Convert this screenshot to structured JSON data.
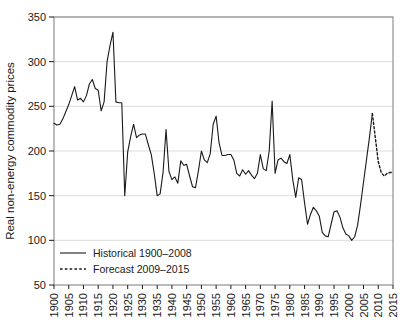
{
  "chart_data": {
    "type": "line",
    "title": "",
    "xlabel": "",
    "ylabel": "Real non-energy commodity prices",
    "xlim": [
      1900,
      2015
    ],
    "ylim": [
      50,
      350
    ],
    "grid": true,
    "legend_position": "bottom-left",
    "y_ticks": [
      50,
      100,
      150,
      200,
      250,
      300,
      350
    ],
    "x_ticks": [
      1900,
      1905,
      1910,
      1915,
      1920,
      1925,
      1930,
      1935,
      1940,
      1945,
      1950,
      1955,
      1960,
      1965,
      1970,
      1975,
      1980,
      1985,
      1990,
      1995,
      2000,
      2005,
      2010,
      2015
    ],
    "series": [
      {
        "name": "Historical 1900–2008",
        "style": "solid",
        "color": "#1a1a1a",
        "x": [
          1900,
          1901,
          1902,
          1903,
          1904,
          1905,
          1906,
          1907,
          1908,
          1909,
          1910,
          1911,
          1912,
          1913,
          1914,
          1915,
          1916,
          1917,
          1918,
          1919,
          1920,
          1921,
          1922,
          1923,
          1924,
          1925,
          1926,
          1927,
          1928,
          1929,
          1930,
          1931,
          1932,
          1933,
          1934,
          1935,
          1936,
          1937,
          1938,
          1939,
          1940,
          1941,
          1942,
          1943,
          1944,
          1945,
          1946,
          1947,
          1948,
          1949,
          1950,
          1951,
          1952,
          1953,
          1954,
          1955,
          1956,
          1957,
          1958,
          1959,
          1960,
          1961,
          1962,
          1963,
          1964,
          1965,
          1966,
          1967,
          1968,
          1969,
          1970,
          1971,
          1972,
          1973,
          1974,
          1975,
          1976,
          1977,
          1978,
          1979,
          1980,
          1981,
          1982,
          1983,
          1984,
          1985,
          1986,
          1987,
          1988,
          1989,
          1990,
          1991,
          1992,
          1993,
          1994,
          1995,
          1996,
          1997,
          1998,
          1999,
          2000,
          2001,
          2002,
          2003,
          2004,
          2005,
          2006,
          2007,
          2008
        ],
        "values": [
          231,
          229,
          230,
          236,
          244,
          252,
          262,
          272,
          257,
          259,
          255,
          262,
          275,
          280,
          270,
          268,
          245,
          255,
          300,
          318,
          333,
          255,
          254,
          254,
          150,
          199,
          216,
          230,
          215,
          218,
          219,
          219,
          207,
          196,
          175,
          150,
          152,
          176,
          224,
          177,
          168,
          171,
          164,
          189,
          184,
          185,
          172,
          160,
          159,
          178,
          200,
          190,
          187,
          197,
          230,
          239,
          209,
          195,
          195,
          196,
          196,
          190,
          175,
          172,
          179,
          174,
          178,
          173,
          169,
          175,
          196,
          180,
          178,
          200,
          256,
          175,
          190,
          192,
          188,
          186,
          196,
          168,
          148,
          170,
          168,
          142,
          118,
          129,
          137,
          133,
          127,
          109,
          105,
          104,
          118,
          132,
          133,
          126,
          114,
          107,
          105,
          100,
          104,
          117,
          140,
          165,
          190,
          215,
          242
        ]
      },
      {
        "name": "Forecast 2009–2015",
        "style": "dashed",
        "color": "#1a1a1a",
        "x": [
          2008,
          2009,
          2010,
          2011,
          2012,
          2013,
          2014,
          2015
        ],
        "values": [
          242,
          215,
          188,
          176,
          172,
          175,
          176,
          176
        ]
      }
    ]
  },
  "legend": {
    "entries": [
      {
        "label": "Historical 1900–2008",
        "style": "solid"
      },
      {
        "label": "Forecast 2009–2015",
        "style": "dashed"
      }
    ]
  },
  "axes": {
    "y_label": "Real non-energy commodity prices"
  }
}
